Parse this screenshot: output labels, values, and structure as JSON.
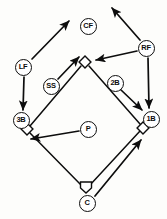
{
  "diagram": {
    "type": "field-diagram",
    "colors": {
      "ink": "#0d0d0d",
      "paper": "#fdfdfb"
    },
    "positions": [
      {
        "id": "lf",
        "label": "LF",
        "name": "left-fielder",
        "x": 23,
        "y": 67
      },
      {
        "id": "cf",
        "label": "CF",
        "name": "center-fielder",
        "x": 88,
        "y": 26
      },
      {
        "id": "rf",
        "label": "RF",
        "name": "right-fielder",
        "x": 146,
        "y": 48
      },
      {
        "id": "ss",
        "label": "SS",
        "name": "shortstop",
        "x": 51,
        "y": 86
      },
      {
        "id": "2b",
        "label": "2B",
        "name": "second-baseman",
        "x": 115,
        "y": 83
      },
      {
        "id": "3b",
        "label": "3B",
        "name": "third-baseman",
        "x": 21,
        "y": 120
      },
      {
        "id": "1b",
        "label": "1B",
        "name": "first-baseman",
        "x": 151,
        "y": 119
      },
      {
        "id": "p",
        "label": "P",
        "name": "pitcher",
        "x": 88,
        "y": 129
      },
      {
        "id": "c",
        "label": "C",
        "name": "catcher",
        "x": 87,
        "y": 203
      }
    ],
    "bases": [
      {
        "id": "second-base",
        "name": "second-base-bag",
        "x": 85,
        "y": 62
      },
      {
        "id": "third-base",
        "name": "third-base-bag",
        "x": 27,
        "y": 129
      },
      {
        "id": "first-base",
        "name": "first-base-bag",
        "x": 143,
        "y": 128
      },
      {
        "id": "home-plate",
        "name": "home-plate",
        "x": 86,
        "y": 187
      }
    ],
    "movement_arrows": [
      {
        "from": "LF",
        "to": "center-field-gap",
        "x1": 32,
        "y1": 59,
        "x2": 69,
        "y2": 21
      },
      {
        "from": "LF",
        "to": "3B",
        "x1": 24,
        "y1": 77,
        "x2": 23,
        "y2": 110
      },
      {
        "from": "RF",
        "to": "right-field-gap",
        "x1": 140,
        "y1": 40,
        "x2": 112,
        "y2": 8
      },
      {
        "from": "RF",
        "to": "second-base",
        "x1": 137,
        "y1": 51,
        "x2": 96,
        "y2": 60
      },
      {
        "from": "RF",
        "to": "1B",
        "x1": 148,
        "y1": 58,
        "x2": 149,
        "y2": 108
      },
      {
        "from": "SS",
        "to": "second-base",
        "x1": 58,
        "y1": 79,
        "x2": 79,
        "y2": 57
      },
      {
        "from": "2B",
        "to": "1B",
        "x1": 120,
        "y1": 89,
        "x2": 142,
        "y2": 110
      },
      {
        "from": "P",
        "to": "third-base",
        "x1": 79,
        "y1": 131,
        "x2": 31,
        "y2": 139
      },
      {
        "from": "C",
        "to": "first-base",
        "x1": 95,
        "y1": 196,
        "x2": 141,
        "y2": 140
      }
    ],
    "baselines": [
      {
        "name": "home-to-first",
        "x1": 90,
        "y1": 185,
        "x2": 140,
        "y2": 131
      },
      {
        "name": "first-to-second",
        "x1": 140,
        "y1": 124,
        "x2": 89,
        "y2": 66
      },
      {
        "name": "second-to-third",
        "x1": 81,
        "y1": 66,
        "x2": 30,
        "y2": 126
      },
      {
        "name": "third-to-home",
        "x1": 30,
        "y1": 133,
        "x2": 82,
        "y2": 186
      }
    ]
  }
}
